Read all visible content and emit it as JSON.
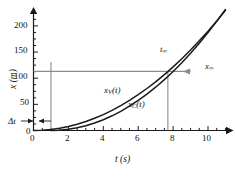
{
  "chart_data": {
    "type": "line",
    "title": "",
    "xlabel": "t (s)",
    "ylabel": "x (m)",
    "xlim": [
      0,
      11
    ],
    "ylim": [
      0,
      225
    ],
    "xticks": [
      0,
      2,
      4,
      6,
      8,
      10
    ],
    "yticks": [
      0,
      50,
      100,
      150,
      200
    ],
    "xminor_step": 0.5,
    "yminor_step": 12.5,
    "grid": false,
    "legend": "inline-curve-labels",
    "series": [
      {
        "name": "x_V(t)",
        "label_plain": "xV(t)",
        "description": "Van position, parabola starting at t = 0",
        "color": "#1a1a1a",
        "x": [
          0,
          0.5,
          1,
          1.5,
          2,
          2.5,
          3,
          3.5,
          4,
          4.5,
          5,
          5.5,
          6,
          6.5,
          7,
          7.5,
          7.7,
          8,
          8.5,
          9,
          9.5,
          10,
          10.5,
          11
        ],
        "y": [
          0,
          0.5,
          1.9,
          4.3,
          7.6,
          11.9,
          17.1,
          23.3,
          30.4,
          38.5,
          47.5,
          57.5,
          68.4,
          80.3,
          93.1,
          106.9,
          112.7,
          121.6,
          137.3,
          153.9,
          171.5,
          190.0,
          209.4,
          229.8
        ]
      },
      {
        "name": "x_C(t)",
        "label_plain": "xC(t)",
        "description": "Car position, parabola delayed by dt, steeper; overtakes at t-infinity",
        "color": "#1a1a1a",
        "x": [
          1,
          1.5,
          2,
          2.5,
          3,
          3.5,
          4,
          4.5,
          5,
          5.5,
          6,
          6.5,
          7,
          7.5,
          7.7,
          8,
          8.5,
          9,
          9.5,
          10,
          10.5,
          11
        ],
        "y": [
          0,
          0.57,
          2.3,
          5.1,
          9.1,
          14.3,
          20.6,
          28.1,
          36.7,
          46.5,
          57.4,
          69.5,
          82.8,
          97.2,
          103.3,
          112.9,
          129.7,
          147.7,
          166.9,
          187.2,
          208.7,
          231.4
        ]
      }
    ],
    "annotations": [
      {
        "name": "delta-t-label",
        "text": "Δt",
        "x_px": 14,
        "y_px": 122,
        "kind": "axis-side-label"
      },
      {
        "name": "t-infinity-label",
        "text": "t∞",
        "x_px": 161,
        "y_px": 48,
        "kind": "point-label"
      },
      {
        "name": "x-infinity-label",
        "text": "x∞",
        "x_px": 203,
        "y_px": 64,
        "kind": "point-label"
      },
      {
        "name": "intersection",
        "t": 7.7,
        "x": 113,
        "kind": "crossing-point"
      },
      {
        "name": "delta-t-span",
        "t_start": 0,
        "t_end": 1,
        "kind": "interval"
      }
    ],
    "guide_lines": [
      {
        "name": "horizontal-x-infinity",
        "orientation": "horizontal",
        "value": 113,
        "from_t": 0,
        "to_t": 9.0
      },
      {
        "name": "vertical-at-delta-t",
        "orientation": "vertical",
        "value": 1,
        "from_x": 0,
        "to_x": 131
      },
      {
        "name": "vertical-t-infinity",
        "orientation": "vertical",
        "value": 7.7,
        "from_x": 0,
        "to_x": 113
      }
    ],
    "colors": {
      "curve": "#1a1a1a",
      "guide": "#8c8c8c",
      "axis": "#1a1a1a",
      "background": "#ffffff"
    }
  },
  "axes": {
    "x_title": "t (s)",
    "y_title": "x (m)",
    "x_tick_labels": [
      "0",
      "2",
      "4",
      "6",
      "8",
      "10"
    ],
    "y_tick_labels": [
      "0",
      "50",
      "100",
      "150",
      "200"
    ]
  },
  "labels": {
    "delta_t": "Δt",
    "t_inf_base": "t",
    "t_inf_sub": "∞",
    "x_inf_base": "x",
    "x_inf_sub": "∞",
    "curve_v_base": "x",
    "curve_v_sub": "V",
    "curve_v_arg": "(t)",
    "curve_c_base": "x",
    "curve_c_sub": "C",
    "curve_c_arg": "(t)"
  }
}
